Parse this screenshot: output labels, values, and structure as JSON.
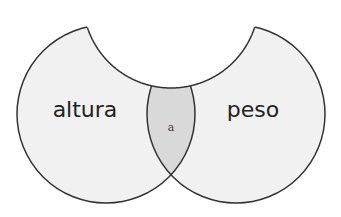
{
  "diagram": {
    "type": "venn",
    "sets": [
      {
        "id": "left",
        "label": "altura"
      },
      {
        "id": "right",
        "label": "peso"
      },
      {
        "id": "top",
        "label": "",
        "note": "third set shown as white cut-out region above"
      }
    ],
    "intersection": {
      "sets": [
        "left",
        "right"
      ],
      "label": "a"
    }
  },
  "colors": {
    "set_fill": "#f1f1f1",
    "intersection_fill": "#d9d9d9",
    "stroke": "#333333",
    "background": "#ffffff",
    "text": "#222222"
  }
}
